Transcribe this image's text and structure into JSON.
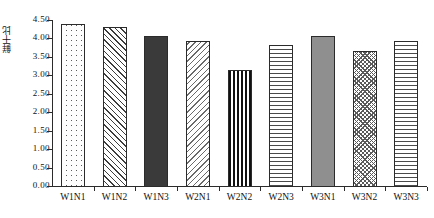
{
  "chart_data": {
    "type": "bar",
    "title": "",
    "subtitle": "",
    "xlabel": "",
    "ylabel": "鲜干比",
    "categories": [
      "W1N1",
      "W1N2",
      "W1N3",
      "W2N1",
      "W2N2",
      "W2N3",
      "W3N1",
      "W3N2",
      "W3N3"
    ],
    "values": [
      4.42,
      4.33,
      4.1,
      3.97,
      3.16,
      3.86,
      4.1,
      3.7,
      3.95
    ],
    "series": [
      {
        "name": "鲜干比",
        "values": [
          4.42,
          4.33,
          4.1,
          3.97,
          3.16,
          3.86,
          4.1,
          3.7,
          3.95
        ]
      }
    ],
    "ylim": [
      0.0,
      4.5
    ],
    "ytick_values": [
      0.0,
      0.5,
      1.0,
      1.5,
      2.0,
      2.5,
      3.0,
      3.5,
      4.0,
      4.5
    ],
    "ytick_labels": [
      "0.00",
      "0.50",
      "1.00",
      "1.50",
      "2.00",
      "2.50",
      "3.00",
      "3.50",
      "4.00",
      "4.50"
    ],
    "grid": false,
    "legend": false,
    "legend_position": "none",
    "bar_patterns": [
      "dots",
      "diagonal-forward-hatch",
      "solid-dark",
      "diagonal-backward-hatch",
      "vertical-stripes",
      "horizontal-lines",
      "solid-gray",
      "crosshatch",
      "horizontal-lines"
    ],
    "colors": {
      "axis": "#2b2b2b",
      "bar_outline": "#2b2b2b",
      "solid_dark_fill": "#3a3a3a",
      "solid_gray_fill": "#8f8f8f",
      "background": "#ffffff",
      "text": "#111111"
    }
  }
}
